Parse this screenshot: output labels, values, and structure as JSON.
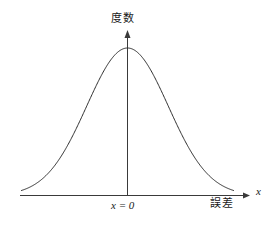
{
  "figure": {
    "kind": "gaussian-error-distribution-plot",
    "background_color": "#ffffff",
    "curve_color": "#2b2b2b",
    "axis_color": "#3a3a3a",
    "text_color": "#1a1a1a"
  },
  "labels": {
    "y_axis": "度数",
    "x_axis_quantity": "誤差",
    "x_variable": "x",
    "center_tick": "x = 0"
  },
  "chart_data": {
    "type": "line",
    "title": "",
    "subtitle": "",
    "xlabel": "誤差",
    "ylabel": "度数",
    "grid": false,
    "legend": null,
    "annotations": [
      {
        "text": "x = 0",
        "x": 0,
        "y": 0,
        "placement": "below-axis-at-center"
      },
      {
        "text": "度数",
        "placement": "above-y-axis-arrow"
      },
      {
        "text": "誤差",
        "placement": "below-axis-right"
      },
      {
        "text": "x",
        "placement": "right-of-x-axis-arrow"
      }
    ],
    "axis_style": {
      "x_axis_arrow": true,
      "y_axis_arrow": true,
      "ticks": false,
      "tick_labels": [
        "x = 0"
      ],
      "xlim": [
        -2.6,
        2.6
      ],
      "ylim": [
        0,
        1.12
      ]
    },
    "series": [
      {
        "name": "normal-distribution",
        "function": "gaussian",
        "mean": 0,
        "sigma": 1,
        "peak_value": 1,
        "x": [
          -2.6,
          -2.4,
          -2.2,
          -2.0,
          -1.8,
          -1.6,
          -1.4,
          -1.2,
          -1.0,
          -0.8,
          -0.6,
          -0.4,
          -0.2,
          0.0,
          0.2,
          0.4,
          0.6,
          0.8,
          1.0,
          1.2,
          1.4,
          1.6,
          1.8,
          2.0,
          2.2,
          2.4,
          2.6
        ],
        "values": [
          0.034,
          0.056,
          0.089,
          0.135,
          0.198,
          0.278,
          0.375,
          0.487,
          0.607,
          0.726,
          0.835,
          0.923,
          0.98,
          1.0,
          0.98,
          0.923,
          0.835,
          0.726,
          0.607,
          0.487,
          0.375,
          0.278,
          0.198,
          0.135,
          0.089,
          0.056,
          0.034
        ]
      }
    ]
  }
}
